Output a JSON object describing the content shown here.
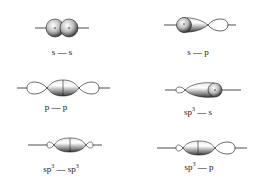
{
  "diagram": {
    "panels": [
      {
        "id": "s-s",
        "left": "s",
        "dash": "—",
        "right": "s",
        "left_sup": "",
        "right_sup": ""
      },
      {
        "id": "s-p",
        "left": "s",
        "dash": "—",
        "right": "p",
        "left_sup": "",
        "right_sup": ""
      },
      {
        "id": "p-p",
        "left": "p",
        "dash": "—",
        "right": "p",
        "left_sup": "",
        "right_sup": ""
      },
      {
        "id": "sp3-s",
        "left": "sp",
        "dash": "—",
        "right": "s",
        "left_sup": "3",
        "right_sup": ""
      },
      {
        "id": "sp3-sp3",
        "left": "sp",
        "dash": "—",
        "right": "sp",
        "left_sup": "3",
        "right_sup": "3"
      },
      {
        "id": "sp3-p",
        "left": "sp",
        "dash": "—",
        "right": "p",
        "left_sup": "3",
        "right_sup": ""
      }
    ],
    "colors": {
      "line": "#222222",
      "shade_light": "#f4f4f4",
      "shade_dark": "#5a5a5a"
    }
  }
}
